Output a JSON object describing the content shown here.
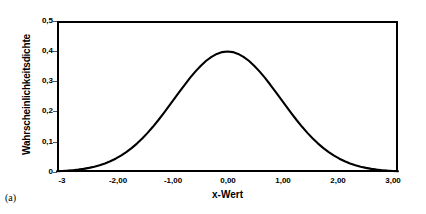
{
  "caption": "(a)",
  "chart_data": {
    "type": "line",
    "title": "",
    "xlabel": "x-Wert",
    "ylabel": "Wahrscheinlichkeitsdichte",
    "xlim": [
      -3.2,
      3.2
    ],
    "ylim": [
      0,
      0.5
    ],
    "grid": false,
    "legend": null,
    "x_tick_labels": [
      "-3",
      "-2,00",
      "-1,00",
      "0,00",
      "1,00",
      "2,00",
      "3,00"
    ],
    "x_tick_values": [
      -3,
      -2,
      -1,
      0,
      1,
      2,
      3
    ],
    "y_tick_labels": [
      "0",
      "0,1",
      "0,2",
      "0,3",
      "0,4",
      "0,5"
    ],
    "y_tick_values": [
      0,
      0.1,
      0.2,
      0.3,
      0.4,
      0.5
    ],
    "series": [
      {
        "name": "Standardnormalverteilung",
        "color": "#000000",
        "x": [
          -3.2,
          -3.1,
          -3.0,
          -2.9,
          -2.8,
          -2.7,
          -2.6,
          -2.5,
          -2.4,
          -2.3,
          -2.2,
          -2.1,
          -2.0,
          -1.9,
          -1.8,
          -1.7,
          -1.6,
          -1.5,
          -1.4,
          -1.3,
          -1.2,
          -1.1,
          -1.0,
          -0.9,
          -0.8,
          -0.7,
          -0.6,
          -0.5,
          -0.4,
          -0.3,
          -0.2,
          -0.1,
          0.0,
          0.1,
          0.2,
          0.3,
          0.4,
          0.5,
          0.6,
          0.7,
          0.8,
          0.9,
          1.0,
          1.1,
          1.2,
          1.3,
          1.4,
          1.5,
          1.6,
          1.7,
          1.8,
          1.9,
          2.0,
          2.1,
          2.2,
          2.3,
          2.4,
          2.5,
          2.6,
          2.7,
          2.8,
          2.9,
          3.0,
          3.1,
          3.2
        ],
        "y": [
          0.0024,
          0.0033,
          0.0044,
          0.006,
          0.0079,
          0.0104,
          0.0136,
          0.0175,
          0.0224,
          0.0283,
          0.0355,
          0.044,
          0.054,
          0.0656,
          0.079,
          0.094,
          0.1109,
          0.1295,
          0.1497,
          0.1714,
          0.1942,
          0.2179,
          0.242,
          0.2661,
          0.2897,
          0.3123,
          0.3332,
          0.3521,
          0.3683,
          0.3814,
          0.391,
          0.397,
          0.3989,
          0.397,
          0.391,
          0.3814,
          0.3683,
          0.3521,
          0.3332,
          0.3123,
          0.2897,
          0.2661,
          0.242,
          0.2179,
          0.1942,
          0.1714,
          0.1497,
          0.1295,
          0.1109,
          0.094,
          0.079,
          0.0656,
          0.054,
          0.044,
          0.0355,
          0.0283,
          0.0224,
          0.0175,
          0.0136,
          0.0104,
          0.0079,
          0.006,
          0.0044,
          0.0033,
          0.0024
        ]
      }
    ],
    "peak": {
      "x": 0.0,
      "y": 0.399
    },
    "colors": {
      "curve": "#000000",
      "axis": "#000000",
      "tick": "#555555",
      "background": "#ffffff"
    }
  }
}
